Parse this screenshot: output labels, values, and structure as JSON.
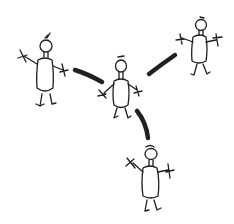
{
  "diagram": {
    "type": "hand-drawn sketch",
    "background": "#ffffff",
    "ink_color": "#1e1e1e",
    "figures": [
      {
        "id": "center",
        "x": 120,
        "y": 67
      },
      {
        "id": "left",
        "x": 45,
        "y": 45
      },
      {
        "id": "top-right",
        "x": 200,
        "y": 25
      },
      {
        "id": "bottom",
        "x": 150,
        "y": 153
      }
    ],
    "connections": [
      {
        "from": "center",
        "to": "left"
      },
      {
        "from": "center",
        "to": "top-right"
      },
      {
        "from": "center",
        "to": "bottom"
      }
    ]
  }
}
